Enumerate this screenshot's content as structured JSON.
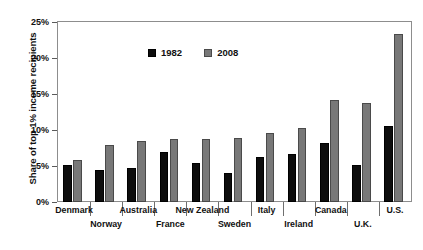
{
  "chart_data": {
    "type": "bar",
    "title": "",
    "subtitle": "",
    "xlabel": "",
    "ylabel": "Share of top 1% income recipients",
    "ylim": [
      0,
      25
    ],
    "ytick_labels": [
      "0%",
      "5%",
      "10%",
      "15%",
      "20%",
      "25%"
    ],
    "ytick_values": [
      0,
      5,
      10,
      15,
      20,
      25
    ],
    "grid": false,
    "legend_position": "top-center",
    "categories": [
      "Denmark",
      "Norway",
      "Australia",
      "France",
      "New Zealand",
      "Sweden",
      "Italy",
      "Ireland",
      "Canada",
      "U.K.",
      "U.S."
    ],
    "series": [
      {
        "name": "1982",
        "color": "#0d0d0d",
        "values": [
          5.1,
          4.5,
          4.7,
          7.0,
          5.4,
          4.0,
          6.3,
          6.7,
          8.2,
          5.1,
          10.6
        ]
      },
      {
        "name": "2008",
        "color": "#787878",
        "values": [
          5.9,
          7.9,
          8.5,
          8.7,
          8.8,
          8.9,
          9.6,
          10.3,
          14.2,
          13.7,
          23.3
        ]
      }
    ]
  },
  "legend": {
    "entries": [
      {
        "label": "1982"
      },
      {
        "label": "2008"
      }
    ]
  }
}
